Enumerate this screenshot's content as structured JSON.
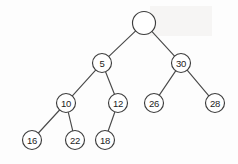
{
  "figure": {
    "name": "binary-tree-diagram",
    "type": "binary-tree",
    "background_color": "#fdfdfd",
    "node_fill_color": "#ffffff",
    "node_stroke_color": "#3d3d3d",
    "edge_color": "#4a4a4a",
    "label_color": "#1d1d1d"
  },
  "nodes": [
    {
      "id": "root",
      "label": "",
      "cx": 144,
      "cy": 23,
      "r": 11.5,
      "level": 0
    },
    {
      "id": "n5",
      "label": "5",
      "cx": 102,
      "cy": 63,
      "r": 9.5,
      "level": 1
    },
    {
      "id": "n30",
      "label": "30",
      "cx": 181,
      "cy": 63,
      "r": 9.5,
      "level": 1
    },
    {
      "id": "n10",
      "label": "10",
      "cx": 66,
      "cy": 103,
      "r": 9.5,
      "level": 2
    },
    {
      "id": "n12",
      "label": "12",
      "cx": 118,
      "cy": 103,
      "r": 9.5,
      "level": 2
    },
    {
      "id": "n26",
      "label": "26",
      "cx": 154,
      "cy": 103,
      "r": 9.5,
      "level": 2
    },
    {
      "id": "n28",
      "label": "28",
      "cx": 215,
      "cy": 103,
      "r": 9.5,
      "level": 2
    },
    {
      "id": "n16",
      "label": "16",
      "cx": 32,
      "cy": 140,
      "r": 9.5,
      "level": 3
    },
    {
      "id": "n22",
      "label": "22",
      "cx": 75,
      "cy": 140,
      "r": 9.5,
      "level": 3
    },
    {
      "id": "n18",
      "label": "18",
      "cx": 105,
      "cy": 140,
      "r": 9.5,
      "level": 3
    }
  ],
  "edges": [
    {
      "id": "edge-root-5",
      "from": "root",
      "to": "n5",
      "side": "left"
    },
    {
      "id": "edge-root-30",
      "from": "root",
      "to": "n30",
      "side": "right"
    },
    {
      "id": "edge-5-10",
      "from": "n5",
      "to": "n10",
      "side": "left"
    },
    {
      "id": "edge-5-12",
      "from": "n5",
      "to": "n12",
      "side": "right"
    },
    {
      "id": "edge-30-26",
      "from": "n30",
      "to": "n26",
      "side": "left"
    },
    {
      "id": "edge-30-28",
      "from": "n30",
      "to": "n28",
      "side": "right"
    },
    {
      "id": "edge-10-16",
      "from": "n10",
      "to": "n16",
      "side": "left"
    },
    {
      "id": "edge-10-22",
      "from": "n10",
      "to": "n22",
      "side": "right"
    },
    {
      "id": "edge-12-18",
      "from": "n12",
      "to": "n18",
      "side": "left"
    }
  ]
}
